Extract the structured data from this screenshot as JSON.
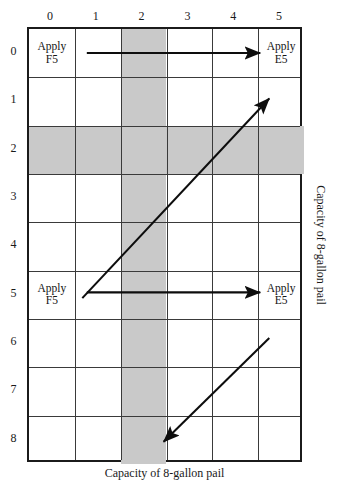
{
  "figure": {
    "title_artifact": "· ·",
    "x_axis_label": "Capacity of 8-gallon pail",
    "y_axis_label": "Capacity of 8-gallon pail"
  },
  "chart_data": {
    "type": "heatmap",
    "title": "",
    "xlabel": "Capacity of 8-gallon pail",
    "ylabel": "Capacity of 8-gallon pail",
    "grid": true,
    "legend": "none",
    "x_tick_labels": [
      "0",
      "1",
      "2",
      "3",
      "4",
      "5"
    ],
    "y_tick_labels": [
      "0",
      "1",
      "2",
      "3",
      "4",
      "5",
      "6",
      "7",
      "8"
    ],
    "xlim": [
      0,
      5
    ],
    "ylim": [
      0,
      8
    ],
    "x_axis_direction": "left-to-right",
    "y_axis_direction": "top-to-bottom",
    "shaded_column_index": 2,
    "shaded_row_index": 2,
    "shade_color": "#c9c9c9",
    "grid_line_color": "#3a3a3a",
    "border_color": "#1b1b1b",
    "annotations": [
      {
        "text": "Apply\nF5",
        "col": 0,
        "row": 0,
        "align": "center"
      },
      {
        "text": "Apply\nE5",
        "col": 5,
        "row": 0,
        "align": "center"
      },
      {
        "text": "Apply\nF5",
        "col": 0,
        "row": 5,
        "align": "center"
      },
      {
        "text": "Apply\nE5",
        "col": 5,
        "row": 5,
        "align": "center"
      }
    ],
    "arrows": [
      {
        "name": "horizontal-arrow-row-0",
        "from": [
          0.78,
          0.0
        ],
        "to": [
          4.62,
          0.0
        ],
        "style": "solid"
      },
      {
        "name": "diagonal-arrow-up-right",
        "from": [
          0.68,
          5.12
        ],
        "to": [
          4.82,
          0.95
        ],
        "style": "solid"
      },
      {
        "name": "horizontal-arrow-row-5",
        "from": [
          0.78,
          5.0
        ],
        "to": [
          4.62,
          5.0
        ],
        "style": "solid"
      },
      {
        "name": "diagonal-arrow-down-left",
        "from": [
          4.82,
          5.95
        ],
        "to": [
          2.48,
          8.12
        ],
        "style": "solid"
      }
    ]
  }
}
